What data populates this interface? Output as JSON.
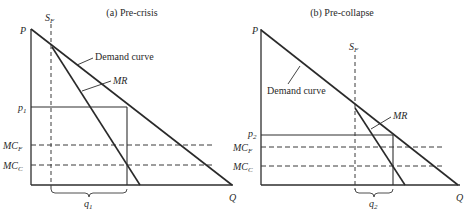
{
  "figure": {
    "panels": [
      {
        "id": "a",
        "title": "(a) Pre-crisis",
        "y_axis_label": "P",
        "x_axis_label": "Q",
        "supply_label": "S",
        "supply_subscript": "F",
        "demand_label": "Demand curve",
        "mr_label": "MR",
        "price_label": "p",
        "price_subscript": "1",
        "mc_f_label": "MC",
        "mc_f_subscript": "F",
        "mc_c_label": "MC",
        "mc_c_subscript": "C",
        "quantity_label": "q",
        "quantity_subscript": "1"
      },
      {
        "id": "b",
        "title": "(b) Pre-collapse",
        "y_axis_label": "P",
        "x_axis_label": "Q",
        "supply_label": "S",
        "supply_subscript": "F",
        "demand_label": "Demand curve",
        "mr_label": "MR",
        "price_label": "p",
        "price_subscript": "2",
        "mc_f_label": "MC",
        "mc_f_subscript": "F",
        "mc_c_label": "MC",
        "mc_c_subscript": "C",
        "quantity_label": "q",
        "quantity_subscript": "2"
      }
    ],
    "colors": {
      "line": "#2a2a2a",
      "background": "#ffffff"
    }
  }
}
